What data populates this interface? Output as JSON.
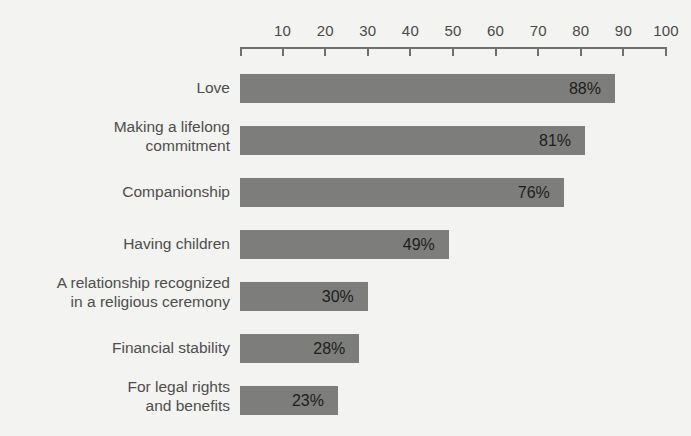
{
  "chart_data": {
    "type": "bar",
    "orientation": "horizontal",
    "title": "",
    "subtitle": "",
    "xlabel": "",
    "ylabel": "",
    "xlim": [
      0,
      100
    ],
    "grid": false,
    "legend": null,
    "axis_ticks": [
      10,
      20,
      30,
      40,
      50,
      60,
      70,
      80,
      90,
      100
    ],
    "axis_tick_labels": [
      "10",
      "20",
      "30",
      "40",
      "50",
      "60",
      "70",
      "80",
      "90",
      "100"
    ],
    "axis_position": "top",
    "bar_color": "#7d7d7b",
    "background_color": "#f3f3f1",
    "text_color": "#4e4e4c",
    "value_suffix": "%",
    "categories": [
      "Love",
      "Making a lifelong\ncommitment",
      "Companionship",
      "Having children",
      "A relationship recognized\nin a religious ceremony",
      "Financial stability",
      "For legal rights\nand benefits"
    ],
    "values": [
      88,
      81,
      76,
      49,
      30,
      28,
      23
    ],
    "value_labels": [
      "88%",
      "81%",
      "76%",
      "49%",
      "30%",
      "28%",
      "23%"
    ]
  },
  "rows": [
    {
      "label": "Love",
      "value": 88,
      "value_label": "88%",
      "lines": 1
    },
    {
      "label": "Making a lifelong\ncommitment",
      "value": 81,
      "value_label": "81%",
      "lines": 2
    },
    {
      "label": "Companionship",
      "value": 76,
      "value_label": "76%",
      "lines": 1
    },
    {
      "label": "Having children",
      "value": 49,
      "value_label": "49%",
      "lines": 1
    },
    {
      "label": "A relationship recognized\nin a religious ceremony",
      "value": 30,
      "value_label": "30%",
      "lines": 2
    },
    {
      "label": "Financial stability",
      "value": 28,
      "value_label": "28%",
      "lines": 1
    },
    {
      "label": "For legal rights\nand benefits",
      "value": 23,
      "value_label": "23%",
      "lines": 2
    }
  ],
  "axis": {
    "ticks": [
      "10",
      "20",
      "30",
      "40",
      "50",
      "60",
      "70",
      "80",
      "90",
      "100"
    ]
  }
}
